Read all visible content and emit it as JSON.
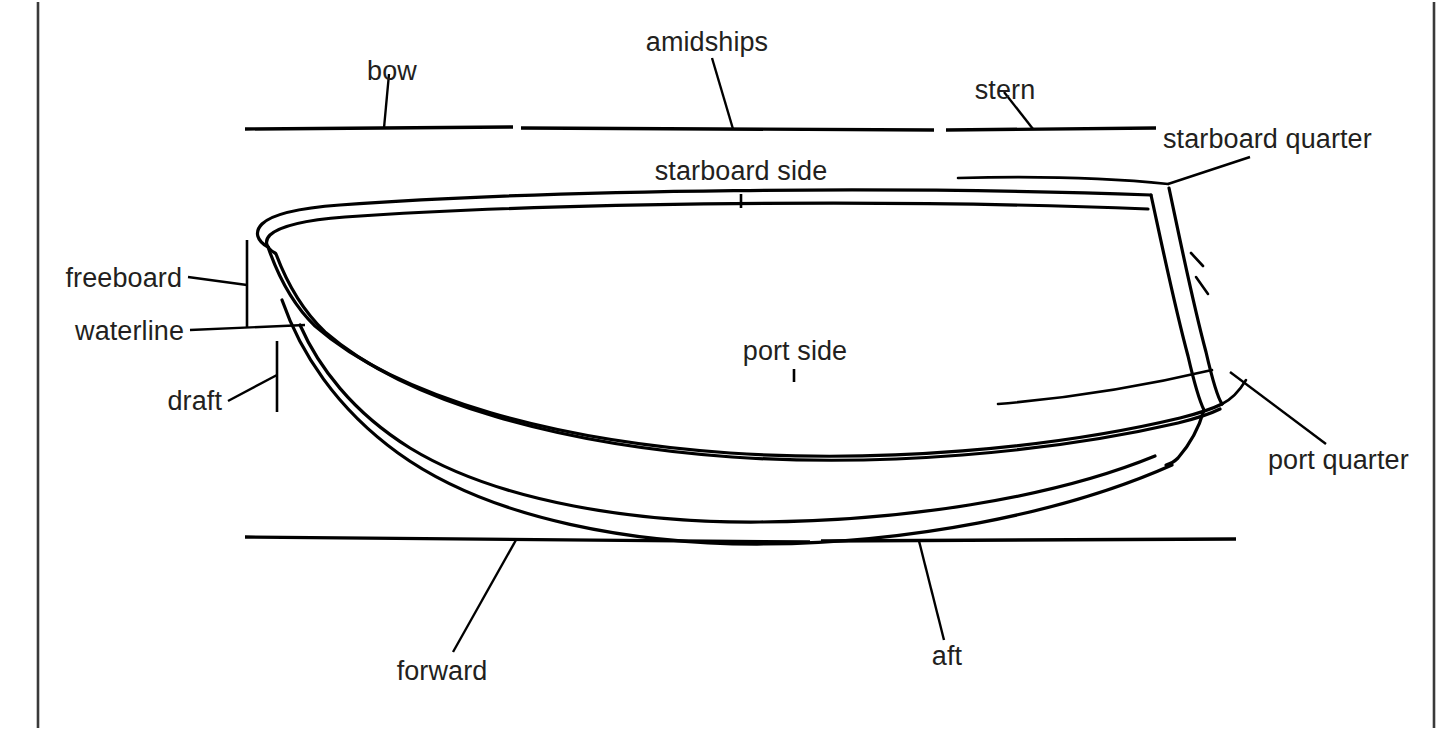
{
  "diagram": {
    "background_color": "#ffffff",
    "line_color": "#000000",
    "text_color": "#231f20",
    "frame": {
      "left_border_x": 38,
      "right_border_x": 1434,
      "color": "#3a3a3a"
    },
    "labels": {
      "bow": "bow",
      "amidships": "amidships",
      "stern": "stern",
      "starboard_quarter": "starboard quarter",
      "starboard_side": "starboard side",
      "port_side": "port side",
      "port_quarter": "port quarter",
      "freeboard": "freeboard",
      "waterline": "waterline",
      "draft": "draft",
      "forward": "forward",
      "aft": "aft"
    },
    "top_reference_segments": [
      {
        "name": "bow-segment",
        "x1": 245,
        "x2": 513,
        "y": 128
      },
      {
        "name": "amidships-segment",
        "x1": 521,
        "x2": 934,
        "y": 128
      },
      {
        "name": "stern-segment",
        "x1": 946,
        "x2": 1156,
        "y": 128
      }
    ],
    "bottom_reference_segments": [
      {
        "name": "forward-segment",
        "x1": 245,
        "x2": 810,
        "y": 539
      },
      {
        "name": "aft-segment",
        "x1": 821,
        "x2": 1236,
        "y": 542
      }
    ],
    "vertical_measures": [
      {
        "name": "freeboard-measure",
        "x": 247,
        "y1": 240,
        "y2": 327
      },
      {
        "name": "draft-measure",
        "x": 277,
        "y1": 341,
        "y2": 412
      }
    ]
  }
}
